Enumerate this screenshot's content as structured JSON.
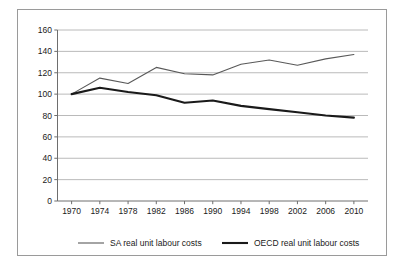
{
  "chart_data": {
    "type": "line",
    "title": "",
    "subtitle": "",
    "xlabel": "",
    "ylabel": "",
    "x": [
      1970,
      1974,
      1978,
      1982,
      1986,
      1990,
      1994,
      1998,
      2002,
      2006,
      2010
    ],
    "xticklabels": [
      "1970",
      "1974",
      "1978",
      "1982",
      "1986",
      "1990",
      "1994",
      "1998",
      "2002",
      "2006",
      "2010"
    ],
    "yticks": [
      0,
      20,
      40,
      60,
      80,
      100,
      120,
      140,
      160
    ],
    "yticklabels": [
      "0",
      "20",
      "40",
      "60",
      "80",
      "100",
      "120",
      "140",
      "160"
    ],
    "ylim": [
      0,
      160
    ],
    "xlim": [
      1968,
      2012
    ],
    "grid": "horizontal",
    "legend_position": "bottom",
    "series": [
      {
        "name": "SA real unit labour costs",
        "color": "#595959",
        "linewidth": 1.1,
        "values": [
          100,
          115,
          110,
          125,
          119,
          118,
          128,
          132,
          127,
          133,
          137
        ]
      },
      {
        "name": "OECD real unit labour costs",
        "color": "#1a1a1a",
        "linewidth": 2.1,
        "values": [
          100,
          106,
          102,
          99,
          92,
          94,
          89,
          86,
          83,
          80,
          78
        ]
      }
    ]
  },
  "legend": {
    "entries": [
      {
        "label": "SA real unit labour costs"
      },
      {
        "label": "OECD real unit labour costs"
      }
    ]
  },
  "colors": {
    "frame": "#9a9a9a",
    "gridline": "#a8a8a8",
    "axis": "#6e6e6e",
    "text": "#1a1a1a",
    "background": "#ffffff"
  }
}
